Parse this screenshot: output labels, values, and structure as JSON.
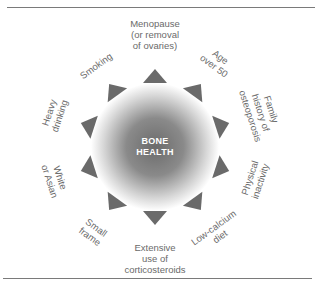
{
  "diagram": {
    "center": {
      "line1": "BONE",
      "line2": "HEALTH"
    },
    "colors": {
      "circle_center": "#6b6b6b",
      "circle_edge": "#ffffff",
      "triangle": "#6a6a6a",
      "label": "#6a6a6a",
      "rule": "#7a7a7a"
    },
    "risk_factors": [
      {
        "lines": [
          "Menopause",
          "(or removal",
          "of ovaries)"
        ]
      },
      {
        "lines": [
          "Age",
          "over 50"
        ]
      },
      {
        "lines": [
          "Family",
          "history of",
          "osteoporosis"
        ]
      },
      {
        "lines": [
          "Physical",
          "inactivity"
        ]
      },
      {
        "lines": [
          "Low-calcium",
          "diet"
        ]
      },
      {
        "lines": [
          "Extensive",
          "use of",
          "corticosteroids"
        ]
      },
      {
        "lines": [
          "Small",
          "frame"
        ]
      },
      {
        "lines": [
          "White",
          "or Asian"
        ]
      },
      {
        "lines": [
          "Heavy",
          "drinking"
        ]
      },
      {
        "lines": [
          "Smoking"
        ]
      }
    ]
  }
}
